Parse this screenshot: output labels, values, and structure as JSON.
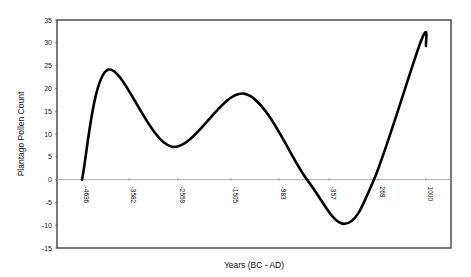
{
  "chart_data": {
    "type": "line",
    "title": "",
    "xlabel": "Years (BC - AD)",
    "ylabel": "Plantago Pollen Count",
    "ylim": [
      -15,
      35
    ],
    "yticks": [
      35,
      30,
      25,
      20,
      15,
      10,
      5,
      0,
      -5,
      -10,
      -15
    ],
    "xtick_labels": [
      "-4636",
      "-3582",
      "-2559",
      "-1505",
      "-983",
      "-357",
      "269",
      "1000"
    ],
    "grid": false,
    "legend": null,
    "series": [
      {
        "name": "Plantago Pollen Count",
        "color": "#000000",
        "points": [
          {
            "x": "-4636",
            "y": 0
          },
          {
            "x": "~-4100",
            "y": 24.1
          },
          {
            "x": "-2559",
            "y": 7.2
          },
          {
            "x": "~-1200",
            "y": 18.8
          },
          {
            "x": "~-650",
            "y": 0
          },
          {
            "x": "~-10",
            "y": -9.7
          },
          {
            "x": "269",
            "y": 0
          },
          {
            "x": "~900",
            "y": 30.4
          },
          {
            "x": "1000",
            "y": 29.3
          }
        ]
      }
    ]
  }
}
